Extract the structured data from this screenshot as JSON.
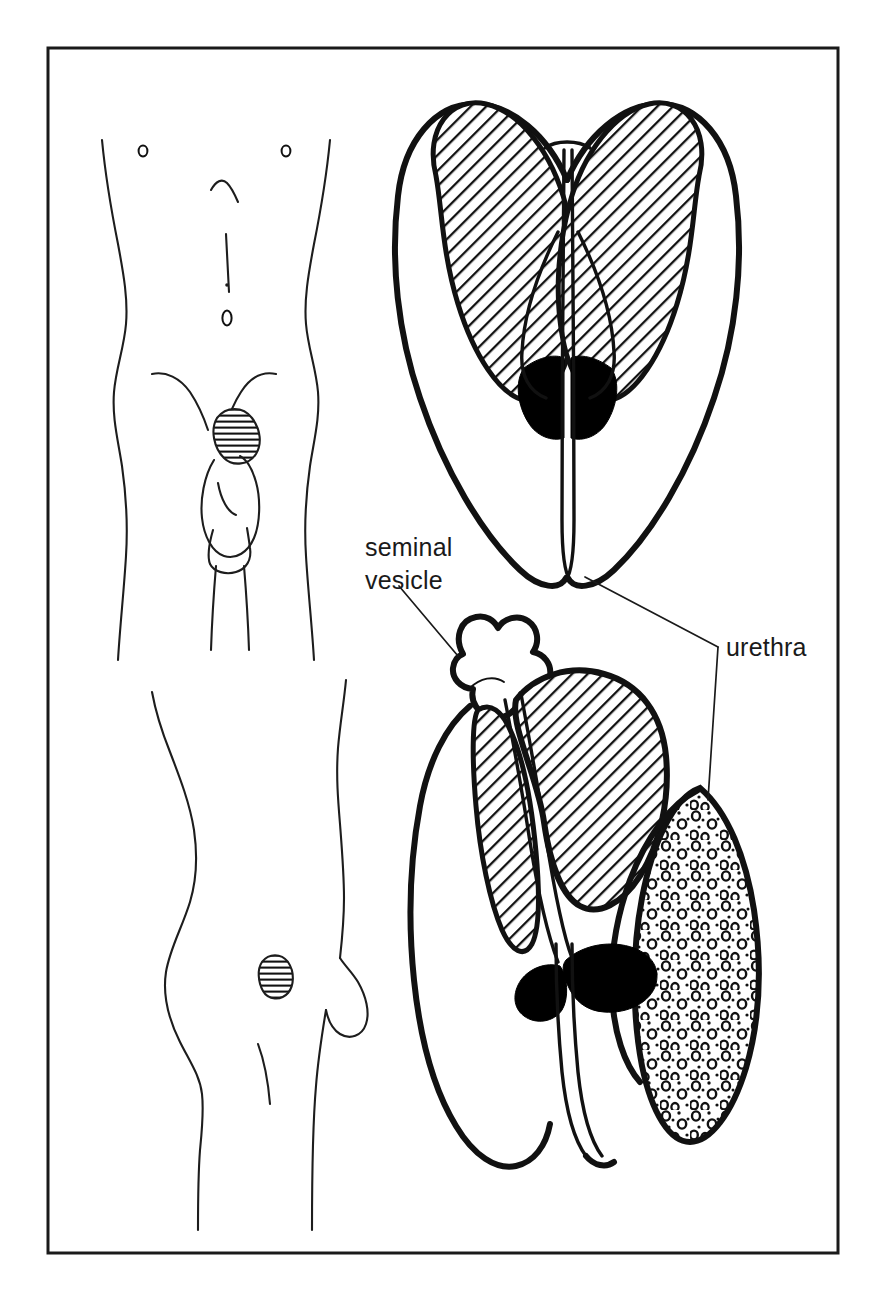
{
  "figure": {
    "background_color": "#ffffff",
    "ink_color": "#111111",
    "frame": {
      "x": 48,
      "y": 48,
      "width": 790,
      "height": 1205,
      "stroke_color": "#1a1a1a",
      "stroke_width": 3
    }
  },
  "labels": [
    {
      "id": "seminal-vesicle",
      "lines": [
        "seminal",
        "vesicle"
      ],
      "line1": "seminal",
      "line2": "vesicle",
      "x": 365,
      "y": 556,
      "font_size": 25
    },
    {
      "id": "urethra",
      "lines": [
        "urethra"
      ],
      "line1": "urethra",
      "x": 726,
      "y": 656,
      "font_size": 25
    }
  ],
  "panels": [
    {
      "id": "anterior-body",
      "name": "anterior torso silhouette",
      "view": "anterior",
      "features": [
        "nipples",
        "sternum-line",
        "linea-alba",
        "navel",
        "groin-creases",
        "hatched-prostate-marker",
        "scrotum",
        "penis"
      ]
    },
    {
      "id": "lateral-body",
      "name": "lateral torso silhouette",
      "view": "lateral",
      "features": [
        "back-curve",
        "buttock",
        "thigh",
        "hatched-prostate-marker"
      ]
    },
    {
      "id": "anterior-organ",
      "name": "anterior coronal section of bladder, seminal vesicles, prostate and urethra",
      "view": "anterior",
      "structures": [
        "bladder-outline",
        "left-seminal-vesicle-hatched",
        "right-seminal-vesicle-hatched",
        "prostate-solid-black",
        "urethra-channel"
      ]
    },
    {
      "id": "lateral-organ",
      "name": "lateral sagittal section of bladder, seminal vesicle, prostate, urethra and rectum",
      "view": "lateral",
      "structures": [
        "bladder-outline",
        "seminal-vesicle-lobed",
        "bladder-hatched",
        "prostate-solid-black",
        "urethra-channel",
        "stippled-rectum"
      ]
    }
  ],
  "fills": {
    "hatch_label": "diagonal line hatching",
    "hatch_angle_degrees": 45,
    "stipple_label": "stippled small circles",
    "solid_label": "solid black (prostate)",
    "horizontal_hatch_label": "horizontal line hatching (surface marker)"
  }
}
